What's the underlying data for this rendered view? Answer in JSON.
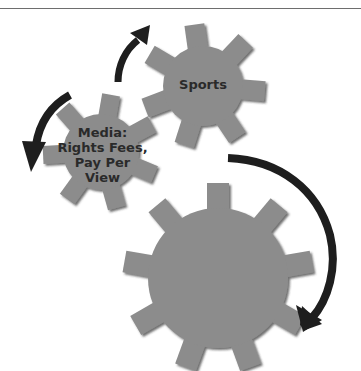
{
  "colors": {
    "gear_fill": "#8c8c8c",
    "gear_shadow": "#3a3a3a",
    "arrow": "#1e1e1e",
    "label": "#2a2a2a",
    "rule": "#6e6e6e"
  },
  "gears": [
    {
      "id": "sports",
      "label": "Sports",
      "cx": 203,
      "cy": 86,
      "r": 40,
      "tooth_len": 22,
      "tooth_w": 20,
      "teeth": 7,
      "rot": -8
    },
    {
      "id": "media",
      "label_lines": [
        "Media:",
        "Rights Fees,",
        "Pay Per",
        "View"
      ],
      "cx": 101,
      "cy": 152,
      "r": 38,
      "tooth_len": 20,
      "tooth_w": 18,
      "teeth": 7,
      "rot": 10
    },
    {
      "id": "large",
      "label": "",
      "cx": 218,
      "cy": 278,
      "r": 70,
      "tooth_len": 25,
      "tooth_w": 22,
      "teeth": 9,
      "rot": 0
    }
  ],
  "arrows": [
    {
      "id": "arrow-top",
      "direction": "up-right"
    },
    {
      "id": "arrow-left",
      "direction": "down-left"
    },
    {
      "id": "arrow-right",
      "direction": "clockwise-down"
    }
  ]
}
